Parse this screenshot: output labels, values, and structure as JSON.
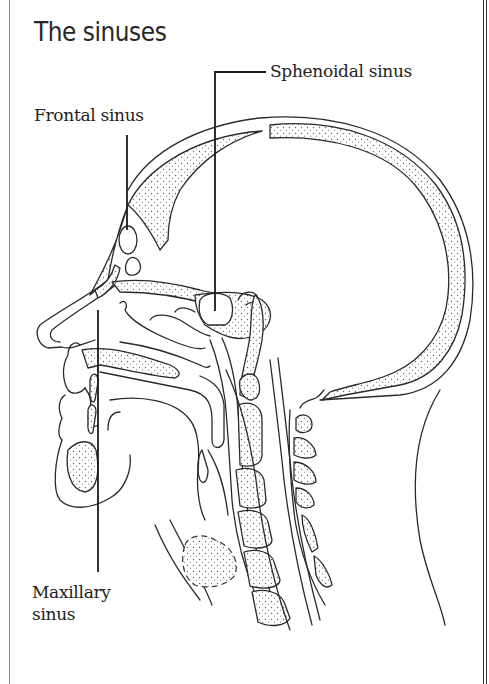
{
  "title": "The sinuses",
  "labels": {
    "frontal": "Frontal sinus",
    "sphenoidal": "Sphenoidal sinus",
    "maxillary_line1": "Maxillary",
    "maxillary_line2": "sinus"
  },
  "figure": {
    "view": "sagittal cross-section of human head and neck",
    "structures_labeled": [
      "Frontal sinus",
      "Sphenoidal sinus",
      "Maxillary sinus"
    ],
    "colors": {
      "line": "#2a2a2a",
      "background": "#ffffff",
      "stipple": "#555555"
    }
  }
}
